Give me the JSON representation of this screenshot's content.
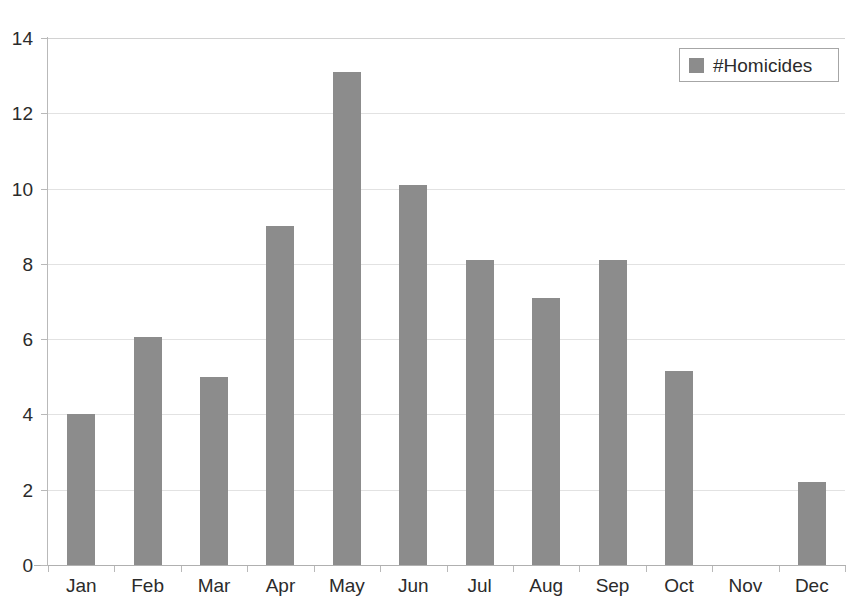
{
  "chart_data": {
    "type": "bar",
    "title": "",
    "xlabel": "",
    "ylabel": "",
    "ylim": [
      0,
      14
    ],
    "yticks": [
      0,
      2,
      4,
      6,
      8,
      10,
      12,
      14
    ],
    "grid": true,
    "legend_position": "top-right",
    "bar_color": "#8c8c8c",
    "gridline_color": "#e2e2e2",
    "axis_color": "#b9b9b9",
    "categories": [
      "Jan",
      "Feb",
      "Mar",
      "Apr",
      "May",
      "Jun",
      "Jul",
      "Aug",
      "Sep",
      "Oct",
      "Nov",
      "Dec"
    ],
    "series": [
      {
        "name": "#Homicides",
        "values": [
          4.0,
          6.05,
          5.0,
          9.0,
          13.1,
          10.1,
          8.1,
          7.1,
          8.1,
          5.15,
          0,
          2.2
        ]
      }
    ]
  },
  "legend": {
    "swatch_name": "homicides-swatch",
    "label": "#Homicides"
  }
}
